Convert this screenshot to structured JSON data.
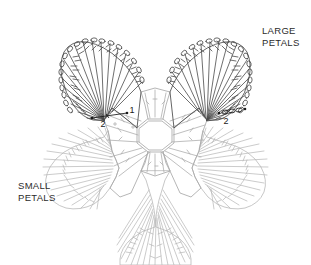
{
  "diagram": {
    "kind": "crochet-stitch-chart",
    "background_color": "#ffffff",
    "annotations": {
      "large_petals_label": {
        "line1": "LARGE",
        "line2": "PETALS",
        "position": "top-right",
        "color": "#2b2b2b"
      },
      "small_petals_label": {
        "line1": "SMALL",
        "line2": "PETALS",
        "position": "lower-left",
        "color": "#2b2b2b"
      },
      "round_numbers": [
        {
          "text": "1",
          "meaning": "round-1-center",
          "position": "center-upper"
        },
        {
          "text": "2",
          "meaning": "round-2-left",
          "position": "left-of-center"
        },
        {
          "text": "2",
          "meaning": "round-2-right",
          "position": "right-of-center"
        }
      ]
    },
    "colors": {
      "large_petal_stroke": "#4a4a4a",
      "small_petal_stroke": "#b4b4b4",
      "center_stroke": "#a9a9a9",
      "label_text": "#2b2b2b",
      "number_text": "#1a1a1a",
      "marker_dot": "#1a1a1a"
    },
    "elements": {
      "center_ring": {
        "name": "octagonal foundation ring",
        "sides": 8,
        "stroke": "#a9a9a9"
      },
      "large_petals": {
        "count": 2,
        "stitch_symbol": "treble-crochet",
        "edge_symbol": "chain-stitch-oval",
        "spokes_per_petal": 19,
        "stroke": "#4a4a4a"
      },
      "small_petals": {
        "count": 3,
        "stitch_symbol": "double-crochet",
        "spokes_per_petal": 19,
        "stroke": "#b4b4b4"
      },
      "chain_markers": {
        "count": 2,
        "symbol": "dot-and-chain-leader",
        "stroke": "#1a1a1a"
      }
    }
  }
}
